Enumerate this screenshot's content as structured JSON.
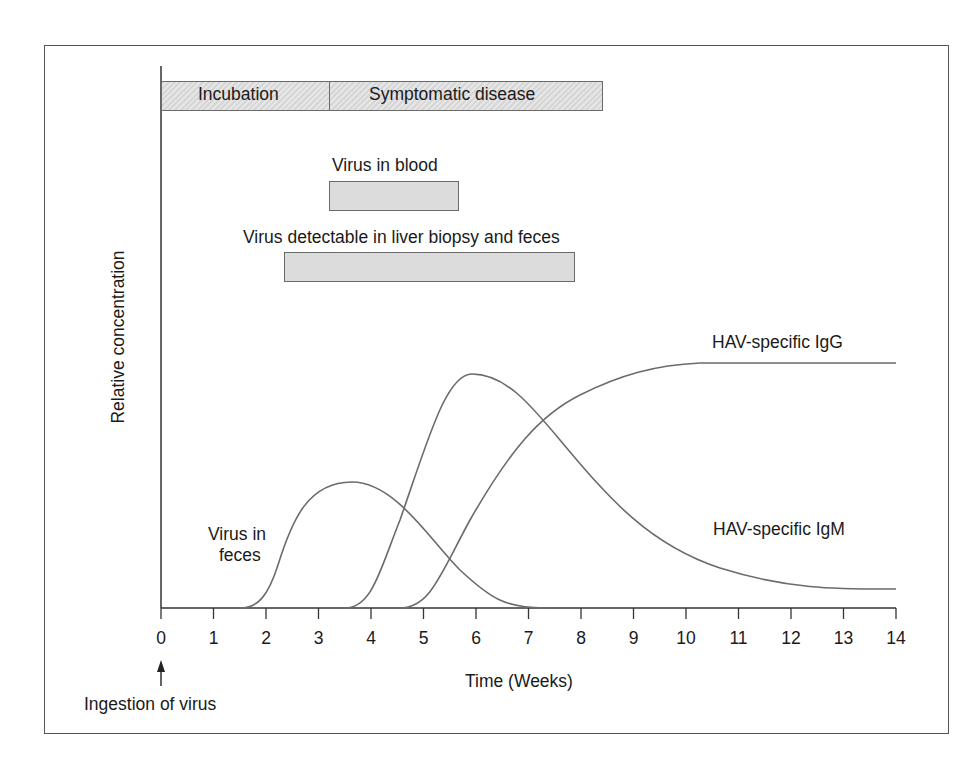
{
  "chart_data": {
    "type": "line",
    "title": "",
    "xlabel": "Time (Weeks)",
    "ylabel": "Relative concentration",
    "xlim": [
      0,
      14
    ],
    "x_ticks": [
      0,
      1,
      2,
      3,
      4,
      5,
      6,
      7,
      8,
      9,
      10,
      11,
      12,
      13,
      14
    ],
    "grid": false,
    "annotations": [
      {
        "text": "Ingestion of virus",
        "x": 0,
        "type": "arrow"
      }
    ],
    "phase_bars": [
      {
        "label": "Incubation",
        "start": 0,
        "end": 3.25,
        "row": 1,
        "hatched": true
      },
      {
        "label": "Symptomatic disease",
        "start": 3.25,
        "end": 8.4,
        "row": 1,
        "hatched": true
      },
      {
        "label": "Virus in blood",
        "start": 3.25,
        "end": 5.65,
        "row": 2,
        "hatched": false
      },
      {
        "label": "Virus detectable in liver biopsy and feces",
        "start": 2.4,
        "end": 7.85,
        "row": 3,
        "hatched": false
      }
    ],
    "series": [
      {
        "name": "Virus in feces",
        "x": [
          1.5,
          2,
          2.5,
          3,
          3.5,
          3.7,
          4,
          4.5,
          5,
          5.5,
          6,
          6.5,
          7,
          7.5
        ],
        "y": [
          0,
          0.06,
          0.22,
          0.36,
          0.41,
          0.415,
          0.405,
          0.34,
          0.24,
          0.14,
          0.065,
          0.02,
          0.003,
          0
        ]
      },
      {
        "name": "HAV-specific IgM",
        "x": [
          3.5,
          4,
          4.5,
          5,
          5.5,
          5.95,
          6.5,
          7,
          8,
          9,
          10,
          11,
          12,
          13,
          14
        ],
        "y": [
          0,
          0.06,
          0.22,
          0.45,
          0.67,
          0.79,
          0.76,
          0.66,
          0.44,
          0.29,
          0.18,
          0.12,
          0.08,
          0.05,
          0.04
        ]
      },
      {
        "name": "HAV-specific IgG",
        "x": [
          4.5,
          5,
          5.5,
          6,
          6.5,
          7,
          7.5,
          8,
          8.5,
          9,
          9.5,
          10,
          11,
          12,
          13,
          14
        ],
        "y": [
          0,
          0.06,
          0.17,
          0.3,
          0.42,
          0.53,
          0.62,
          0.69,
          0.74,
          0.77,
          0.79,
          0.8,
          0.8,
          0.8,
          0.8,
          0.8
        ]
      }
    ]
  },
  "labels": {
    "incubation": "Incubation",
    "symptomatic": "Symptomatic disease",
    "blood": "Virus in blood",
    "liver": "Virus detectable in liver biopsy and feces",
    "feces_line1": "Virus in",
    "feces_line2": "feces",
    "igg": "HAV-specific IgG",
    "igm": "HAV-specific IgM",
    "ingestion": "Ingestion of virus",
    "xlabel": "Time (Weeks)",
    "ylabel": "Relative concentration"
  },
  "ticks": [
    "0",
    "1",
    "2",
    "3",
    "4",
    "5",
    "6",
    "7",
    "8",
    "9",
    "10",
    "11",
    "12",
    "13",
    "14"
  ],
  "colors": {
    "line": "#6b6b6b",
    "axis": "#333333",
    "bar_fill": "#dcdcdc",
    "bar_border": "#6a6a6a"
  }
}
